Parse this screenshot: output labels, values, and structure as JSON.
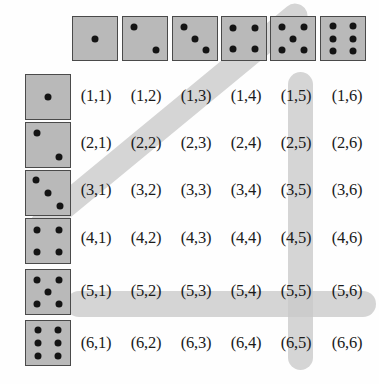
{
  "figure": {
    "type": "sample-space-grid",
    "rows": 6,
    "columns": 6,
    "background_color": "#fefefe",
    "die_face_color": "#b9b9b9",
    "die_border_color": "#4a4a4a",
    "pip_color": "#141414",
    "highlight_color": "#c9c9c9"
  },
  "column_header_dice": [
    {
      "name": "die-face-1",
      "value": 1,
      "pips": [
        [
          50,
          50
        ]
      ]
    },
    {
      "name": "die-face-2",
      "value": 2,
      "pips": [
        [
          26,
          24
        ],
        [
          74,
          76
        ]
      ]
    },
    {
      "name": "die-face-3",
      "value": 3,
      "pips": [
        [
          24,
          23
        ],
        [
          50,
          50
        ],
        [
          76,
          77
        ]
      ]
    },
    {
      "name": "die-face-4",
      "value": 4,
      "pips": [
        [
          26,
          25
        ],
        [
          74,
          25
        ],
        [
          26,
          75
        ],
        [
          74,
          75
        ]
      ]
    },
    {
      "name": "die-face-5",
      "value": 5,
      "pips": [
        [
          25,
          24
        ],
        [
          75,
          24
        ],
        [
          50,
          50
        ],
        [
          25,
          76
        ],
        [
          75,
          76
        ]
      ]
    },
    {
      "name": "die-face-6",
      "value": 6,
      "pips": [
        [
          28,
          22
        ],
        [
          72,
          22
        ],
        [
          28,
          50
        ],
        [
          72,
          50
        ],
        [
          28,
          78
        ],
        [
          72,
          78
        ]
      ]
    }
  ],
  "row_header_dice": [
    {
      "name": "die-face-1",
      "value": 1,
      "pips": [
        [
          50,
          50
        ]
      ]
    },
    {
      "name": "die-face-2",
      "value": 2,
      "pips": [
        [
          24,
          23
        ],
        [
          76,
          77
        ]
      ]
    },
    {
      "name": "die-face-3",
      "value": 3,
      "pips": [
        [
          22,
          20
        ],
        [
          50,
          50
        ],
        [
          78,
          80
        ]
      ]
    },
    {
      "name": "die-face-4",
      "value": 4,
      "pips": [
        [
          25,
          24
        ],
        [
          75,
          24
        ],
        [
          25,
          76
        ],
        [
          75,
          76
        ]
      ]
    },
    {
      "name": "die-face-5",
      "value": 5,
      "pips": [
        [
          24,
          22
        ],
        [
          76,
          22
        ],
        [
          50,
          50
        ],
        [
          24,
          78
        ],
        [
          76,
          78
        ]
      ]
    },
    {
      "name": "die-face-6",
      "value": 6,
      "pips": [
        [
          27,
          20
        ],
        [
          73,
          20
        ],
        [
          27,
          50
        ],
        [
          73,
          50
        ],
        [
          27,
          80
        ],
        [
          73,
          80
        ]
      ]
    }
  ],
  "grid": {
    "rows": [
      {
        "row_label": 1,
        "cells": [
          "(1,1)",
          "(1,2)",
          "(1,3)",
          "(1,4)",
          "(1,5)",
          "(1,6)"
        ]
      },
      {
        "row_label": 2,
        "cells": [
          "(2,1)",
          "(2,2)",
          "(2,3)",
          "(2,4)",
          "(2,5)",
          "(2,6)"
        ]
      },
      {
        "row_label": 3,
        "cells": [
          "(3,1)",
          "(3,2)",
          "(3,3)",
          "(3,4)",
          "(3,5)",
          "(3,6)"
        ]
      },
      {
        "row_label": 4,
        "cells": [
          "(4,1)",
          "(4,2)",
          "(4,3)",
          "(4,4)",
          "(4,5)",
          "(4,6)"
        ]
      },
      {
        "row_label": 5,
        "cells": [
          "(5,1)",
          "(5,2)",
          "(5,3)",
          "(5,4)",
          "(5,5)",
          "(5,6)"
        ]
      },
      {
        "row_label": 6,
        "cells": [
          "(6,1)",
          "(6,2)",
          "(6,3)",
          "(6,4)",
          "(6,5)",
          "(6,6)"
        ]
      }
    ]
  },
  "highlights": [
    {
      "name": "row-5-highlight",
      "orientation": "horizontal",
      "covers": "row 5: (5,1) through (5,6)"
    },
    {
      "name": "column-5-highlight",
      "orientation": "vertical",
      "covers": "column 5: (1,5) through (6,5)"
    },
    {
      "name": "diagonal-highlight",
      "orientation": "diagonal",
      "covers": "anti-diagonal: (6,1) through (1,6)"
    }
  ]
}
